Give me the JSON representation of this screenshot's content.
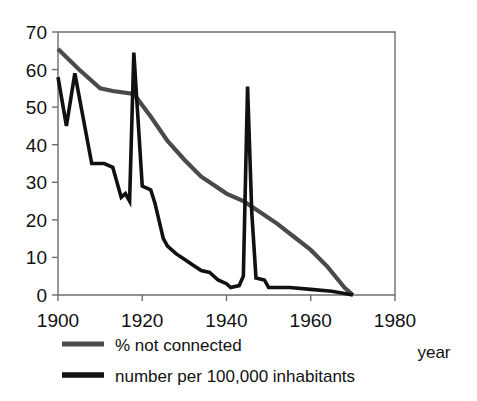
{
  "chart_data": {
    "type": "line",
    "title": "",
    "xlabel": "year",
    "ylabel": "",
    "xlim": [
      1900,
      1980
    ],
    "ylim": [
      0,
      70
    ],
    "grid": false,
    "legend_position": "below-axis-left",
    "x_ticks": [
      "1900",
      "1920",
      "1940",
      "1960",
      "1980"
    ],
    "x_tick_values": [
      1900,
      1920,
      1940,
      1960,
      1980
    ],
    "y_ticks": [
      "0",
      "10",
      "20",
      "30",
      "40",
      "50",
      "60",
      "70"
    ],
    "y_tick_values": [
      0,
      10,
      20,
      30,
      40,
      50,
      60,
      70
    ],
    "series": [
      {
        "name": "% not connected",
        "color": "#4a4a4a",
        "width": 4.2,
        "x": [
          1900,
          1905,
          1910,
          1913,
          1918,
          1922,
          1926,
          1930,
          1934,
          1936,
          1940,
          1944,
          1948,
          1952,
          1956,
          1960,
          1964,
          1968,
          1970
        ],
        "values": [
          65.5,
          60.0,
          55.0,
          54.3,
          53.5,
          47.5,
          41.0,
          36.0,
          31.5,
          30.0,
          27.0,
          25.0,
          22.0,
          19.0,
          15.5,
          12.0,
          7.5,
          2.0,
          0.0
        ]
      },
      {
        "name": "number per 100,000 inhabitants",
        "color": "#111111",
        "width": 3.6,
        "x": [
          1900,
          1902,
          1904,
          1908,
          1911,
          1913,
          1915,
          1916,
          1917,
          1918,
          1920,
          1922,
          1923,
          1925,
          1926,
          1928,
          1930,
          1932,
          1934,
          1936,
          1938,
          1940,
          1941,
          1943,
          1944,
          1945,
          1946,
          1947,
          1949,
          1950,
          1955,
          1960,
          1965,
          1970
        ],
        "values": [
          58.0,
          45.0,
          59.0,
          35.0,
          35.0,
          34.0,
          26.0,
          27.0,
          25.0,
          64.5,
          29.0,
          28.0,
          24.5,
          15.0,
          13.0,
          11.0,
          9.5,
          8.0,
          6.5,
          6.0,
          4.0,
          3.0,
          2.0,
          2.5,
          5.0,
          55.5,
          22.0,
          4.5,
          4.0,
          2.0,
          2.0,
          1.5,
          1.0,
          0.0
        ]
      }
    ]
  },
  "legend": {
    "items": [
      {
        "label": "% not connected"
      },
      {
        "label": "number per 100,000 inhabitants"
      }
    ]
  },
  "axis": {
    "x_title": "year"
  }
}
